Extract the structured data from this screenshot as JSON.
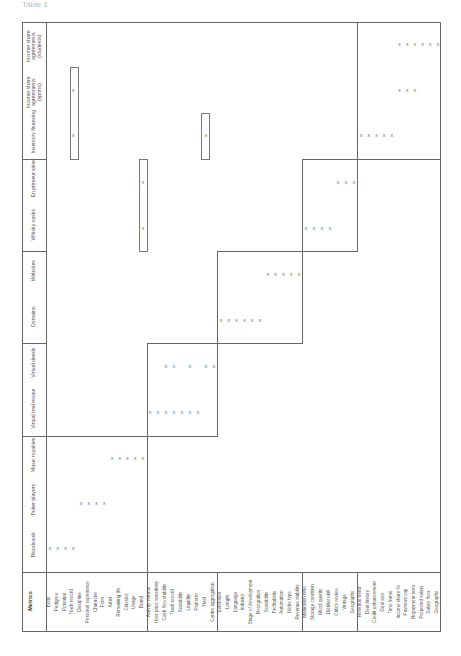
{
  "caption": "Table 1",
  "table": {
    "metrics_header": "Metrics",
    "columns": [
      {
        "id": "bloodstock",
        "label": "Bloodstock",
        "y": 548
      },
      {
        "id": "poker",
        "label": "Poker players",
        "y": 503
      },
      {
        "id": "music",
        "label": "Music royalties",
        "y": 458
      },
      {
        "id": "vre",
        "label": "Virtual real estate",
        "y": 412
      },
      {
        "id": "vdeeds",
        "label": "Virtual deeds",
        "y": 366
      },
      {
        "id": "domains",
        "label": "Domains",
        "y": 320
      },
      {
        "id": "websites",
        "label": "Websites",
        "y": 274
      },
      {
        "id": "whisky",
        "label": "Whisky casks",
        "y": 228
      },
      {
        "id": "wine",
        "label": "En primeur wine",
        "y": 182
      },
      {
        "id": "inventory",
        "label": "Inventory financing",
        "y": 135
      },
      {
        "id": "isa_sports",
        "label": "Income share agreements (sports)",
        "y": 90
      },
      {
        "id": "isa_students",
        "label": "Income share agreements (students)",
        "y": 44
      }
    ],
    "metric_groups": [
      {
        "name": "group-1",
        "metrics": [
          "Body",
          "Pedigree",
          "Potential",
          "Track record",
          "Discipline",
          "Personal experience",
          "Character",
          "Form",
          "Artist",
          "Remaining life",
          "Classics",
          "Usage",
          "Brand"
        ]
      },
      {
        "name": "group-2",
        "metrics": [
          "Activity volume",
          "User price sensitivity",
          "Cash flow stability",
          "Track record",
          "Scalability",
          "Liquidity",
          "Platform",
          "Yield",
          "Centre aggregation"
        ]
      },
      {
        "name": "group-3",
        "metrics": [
          "Extension",
          "Length",
          "Language",
          "Industry",
          "Stage of development",
          "Recognition",
          "Scalability",
          "Profitability",
          "Automation",
          "Niche type",
          "Revenue stability"
        ]
      },
      {
        "name": "group-4",
        "metrics": [
          "Maturation time",
          "Storage condition",
          "Wood quality",
          "Distiller skill",
          "Critics review",
          "Vintage",
          "Geography"
        ]
      },
      {
        "name": "group-5",
        "metrics": [
          "Revenue trend",
          "Deal history",
          "Credit enhancement",
          "Deal size",
          "Time frame",
          "Income share %",
          "Payment cap",
          "Repayment term",
          "Projected salary",
          "Salary floor",
          "Geography"
        ]
      }
    ],
    "mark_symbol": "x",
    "marks": {
      "bloodstock": [
        [
          0,
          0
        ],
        [
          0,
          1
        ],
        [
          0,
          2
        ],
        [
          0,
          3
        ]
      ],
      "poker": [
        [
          0,
          4
        ],
        [
          0,
          5
        ],
        [
          0,
          6
        ],
        [
          0,
          7
        ]
      ],
      "music": [
        [
          0,
          8
        ],
        [
          0,
          9
        ],
        [
          0,
          10
        ],
        [
          0,
          11
        ],
        [
          0,
          12
        ]
      ],
      "vre": [
        [
          1,
          0
        ],
        [
          1,
          1
        ],
        [
          1,
          2
        ],
        [
          1,
          3
        ],
        [
          1,
          4
        ],
        [
          1,
          5
        ],
        [
          1,
          6
        ]
      ],
      "vdeeds": [
        [
          1,
          2
        ],
        [
          1,
          3
        ],
        [
          1,
          5
        ],
        [
          1,
          7
        ],
        [
          1,
          8
        ]
      ],
      "domains": [
        [
          2,
          0
        ],
        [
          2,
          1
        ],
        [
          2,
          2
        ],
        [
          2,
          3
        ],
        [
          2,
          4
        ],
        [
          2,
          5
        ]
      ],
      "websites": [
        [
          2,
          6
        ],
        [
          2,
          7
        ],
        [
          2,
          8
        ],
        [
          2,
          9
        ],
        [
          2,
          10
        ]
      ],
      "whisky": [
        [
          3,
          0
        ],
        [
          3,
          1
        ],
        [
          3,
          2
        ],
        [
          3,
          3
        ],
        [
          0,
          12
        ]
      ],
      "wine": [
        [
          3,
          4
        ],
        [
          3,
          5
        ],
        [
          3,
          6
        ],
        [
          0,
          12
        ]
      ],
      "inventory": [
        [
          4,
          0
        ],
        [
          4,
          1
        ],
        [
          4,
          2
        ],
        [
          4,
          3
        ],
        [
          4,
          4
        ],
        [
          0,
          3
        ],
        [
          1,
          7
        ]
      ],
      "isa_sports": [
        [
          4,
          5
        ],
        [
          4,
          6
        ],
        [
          4,
          7
        ],
        [
          0,
          3
        ]
      ],
      "isa_students": [
        [
          4,
          5
        ],
        [
          4,
          6
        ],
        [
          4,
          7
        ],
        [
          4,
          8
        ],
        [
          4,
          9
        ],
        [
          4,
          10
        ]
      ]
    }
  }
}
